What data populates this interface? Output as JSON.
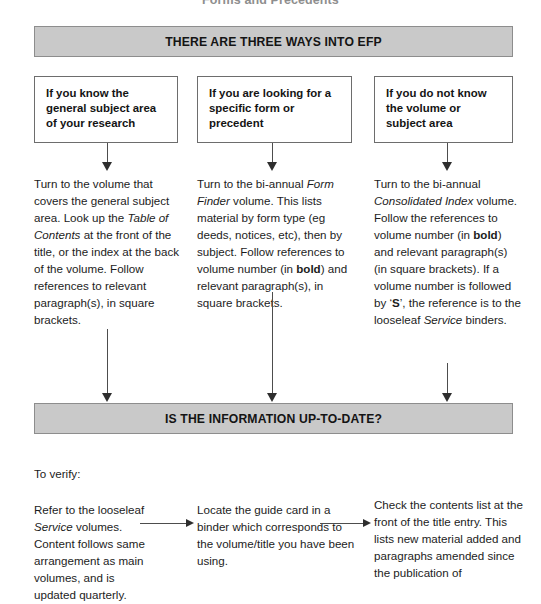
{
  "page": {
    "running_head": "Forms and Precedents"
  },
  "banners": [
    {
      "id": "top",
      "text": "THERE ARE THREE WAYS INTO EFP"
    },
    {
      "id": "mid",
      "text": "IS THE INFORMATION UP-TO-DATE?"
    }
  ],
  "question_boxes": [
    {
      "text": "If you know the general subject area of your research"
    },
    {
      "text": "If you are looking for a specific form or precedent"
    },
    {
      "text": "If you do not know the volume or subject area"
    }
  ],
  "columns": [
    {
      "plain_text": "Turn to the volume that covers the general subject area. Look up the Table of Contents at the front of the title, or the index at the back of the volume. Follow references to relevant paragraph(s), in square brackets.",
      "segments": [
        {
          "style": "normal",
          "text": "Turn to the volume that covers the general subject area. Look up the "
        },
        {
          "style": "italic",
          "text": "Table of Contents"
        },
        {
          "style": "normal",
          "text": " at the front of the title, or the index at the back of the volume. Follow references to relevant paragraph(s), in square brackets."
        }
      ]
    },
    {
      "plain_text": "Turn to the bi-annual Form Finder volume. This lists material by form type (eg deeds, notices, etc), then by subject. Follow references to volume number (in bold) and relevant paragraph(s), in square brackets.",
      "segments": [
        {
          "style": "normal",
          "text": "Turn to the bi-annual "
        },
        {
          "style": "italic",
          "text": "Form Finder"
        },
        {
          "style": "normal",
          "text": " volume. This lists material by form type (eg deeds, notices, etc), then by subject. Follow references to volume number (in "
        },
        {
          "style": "bold",
          "text": "bold"
        },
        {
          "style": "normal",
          "text": ") and relevant paragraph(s), in square brackets."
        }
      ]
    },
    {
      "plain_text": "Turn to the bi-annual Consolidated Index volume. Follow the references to volume number (in bold) and relevant paragraph(s) (in square brackets). If a volume number is followed by 'S', the reference is to the looseleaf Service binders.",
      "segments": [
        {
          "style": "normal",
          "text": "Turn to the bi-annual "
        },
        {
          "style": "italic",
          "text": "Consolidated Index"
        },
        {
          "style": "normal",
          "text": " volume. Follow the references to volume number (in "
        },
        {
          "style": "bold",
          "text": "bold"
        },
        {
          "style": "normal",
          "text": ") and relevant paragraph(s) (in square brackets). If a volume number is followed by ‘"
        },
        {
          "style": "bold",
          "text": "S"
        },
        {
          "style": "normal",
          "text": "’, the reference is to the looseleaf "
        },
        {
          "style": "italic",
          "text": "Service"
        },
        {
          "style": "normal",
          "text": " binders."
        }
      ]
    }
  ],
  "lower": {
    "intro": "To verify:",
    "columns": [
      {
        "plain_text": "Refer to the looseleaf Service volumes. Content follows same arrangement as main volumes, and is updated quarterly.",
        "segments": [
          {
            "style": "normal",
            "text": "Refer to the looseleaf "
          },
          {
            "style": "italic",
            "text": "Service"
          },
          {
            "style": "normal",
            "text": " volumes. Content follows same arrangement as main volumes, and is updated quarterly."
          }
        ]
      },
      {
        "plain_text": "Locate the guide card in a binder which corresponds to the volume/title you have been using.",
        "segments": [
          {
            "style": "normal",
            "text": "Locate the guide card in a binder which corresponds to the volume/title you have been using."
          }
        ]
      },
      {
        "plain_text": "Check the contents list at the front of the title entry. This lists new material added and paragraphs amended since the publication of",
        "segments": [
          {
            "style": "normal",
            "text": "Check the contents list at the front of the title entry. This lists new material added and paragraphs amended since the publication of"
          }
        ]
      }
    ]
  },
  "colors": {
    "banner_fill": "#c9c9c9",
    "banner_border": "#8d8d8d",
    "box_border": "#6d6d6d",
    "text": "#1c1c1c",
    "connector": "#4d4d4d",
    "running_head": "#8e8e8e"
  }
}
